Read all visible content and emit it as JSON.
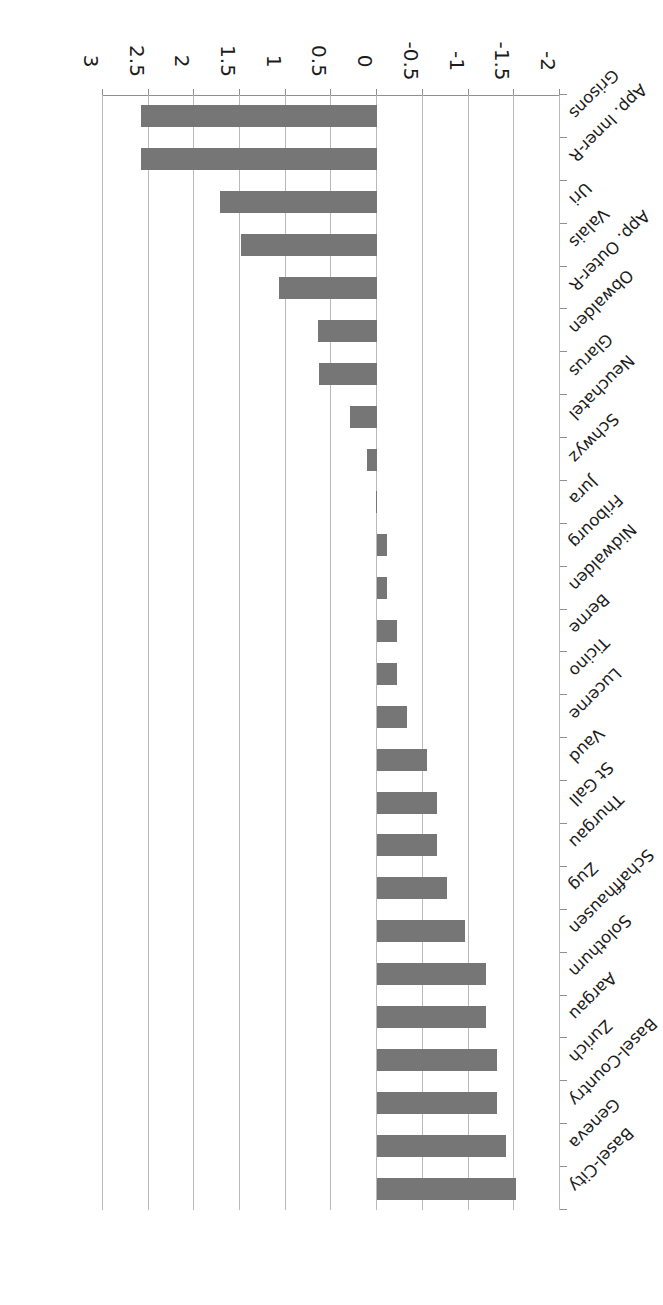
{
  "chart_data": {
    "type": "bar",
    "orientation": "horizontal",
    "title": "",
    "subtitle": "",
    "xlabel": "",
    "ylabel": "",
    "xlim": [
      -2,
      3
    ],
    "xticks": [
      "-2",
      "-1.5",
      "-1",
      "-0.5",
      "0",
      "0.5",
      "1",
      "1.5",
      "2",
      "2.5",
      "3"
    ],
    "grid": "vertical gridlines at every x tick",
    "legend": "none",
    "bar_color": "#767676",
    "categories": [
      "Basel-City",
      "Geneva",
      "Basel-Country",
      "Zurich",
      "Aargau",
      "Solothurn",
      "Schaffhausen",
      "Zug",
      "Thurgau",
      "St Gall",
      "Vaud",
      "Lucerne",
      "Ticino",
      "Berne",
      "Nidwalden",
      "Fribourg",
      "Jura",
      "Schwyz",
      "Neuchatel",
      "Glarus",
      "Obwalden",
      "App. Outer-R",
      "Valais",
      "Uri",
      "App. Inner-R",
      "Grisons"
    ],
    "values": [
      -1.52,
      -1.41,
      -1.31,
      -1.31,
      -1.19,
      -1.19,
      -0.96,
      -0.76,
      -0.65,
      -0.65,
      -0.55,
      -0.33,
      -0.22,
      -0.22,
      -0.11,
      -0.11,
      0.0,
      0.11,
      0.3,
      0.64,
      0.65,
      1.07,
      1.49,
      1.72,
      2.58,
      2.58
    ]
  }
}
